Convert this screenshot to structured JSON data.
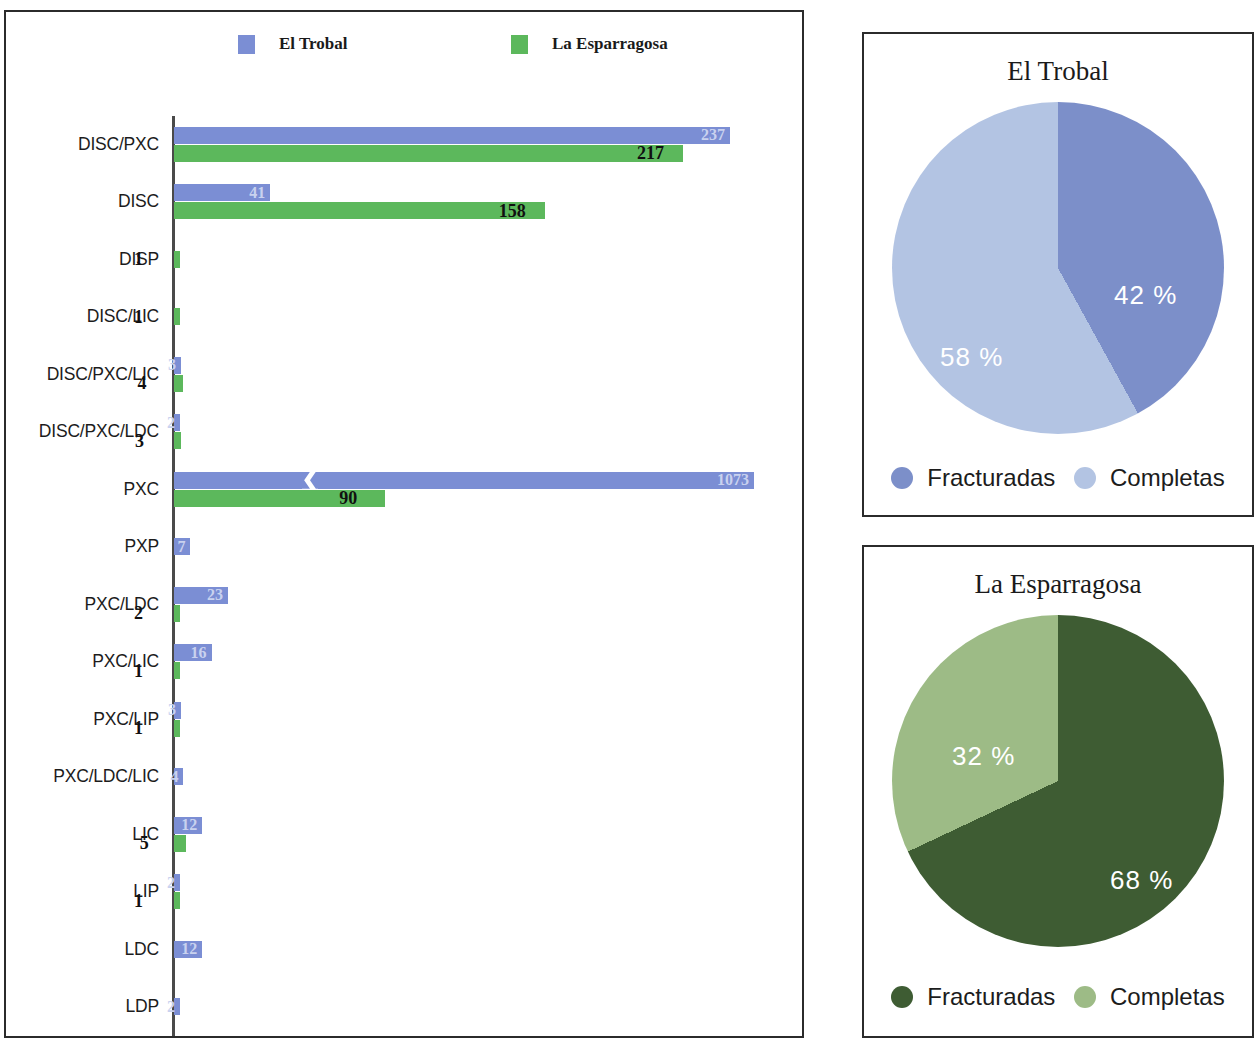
{
  "colors": {
    "trobal_bar": "#7b8ed4",
    "esparragosa_bar": "#5cb85c",
    "trobal_fracturadas": "#7c8fc9",
    "trobal_completas": "#b3c4e3",
    "esparragosa_fracturadas": "#3e5c33",
    "esparragosa_completas": "#9dbb86",
    "frame": "#2b2b2b"
  },
  "bar_legend": {
    "trobal": "El Trobal",
    "esparragosa": "La Esparragosa"
  },
  "chart_data": [
    {
      "type": "bar",
      "orientation": "horizontal",
      "title": "",
      "xlabel": "",
      "ylabel": "",
      "grid": false,
      "legend_position": "top",
      "axis_break": {
        "series": "El Trobal",
        "category": "PXC"
      },
      "categories": [
        "DISC/PXC",
        "DISC",
        "DISP",
        "DISC/LIC",
        "DISC/PXC/LIC",
        "DISC/PXC/LDC",
        "PXC",
        "PXP",
        "PXC/LDC",
        "PXC/LIC",
        "PXC/LIP",
        "PXC/LDC/LIC",
        "LIC",
        "LIP",
        "LDC",
        "LDP"
      ],
      "series": [
        {
          "name": "El Trobal",
          "color": "#7b8ed4",
          "values": [
            237,
            41,
            0,
            0,
            3,
            2,
            1073,
            7,
            23,
            16,
            3,
            4,
            12,
            2,
            12,
            2
          ]
        },
        {
          "name": "La Esparragosa",
          "color": "#5cb85c",
          "values": [
            217,
            158,
            1,
            1,
            4,
            3,
            90,
            0,
            2,
            1,
            1,
            0,
            5,
            1,
            0,
            0
          ]
        }
      ]
    },
    {
      "type": "pie",
      "title": "El Trobal",
      "labels": [
        "Fracturadas",
        "Completas"
      ],
      "values": [
        42,
        58
      ],
      "value_labels": [
        "42 %",
        "58 %"
      ],
      "colors": [
        "#7c8fc9",
        "#b3c4e3"
      ],
      "legend_position": "bottom"
    },
    {
      "type": "pie",
      "title": "La Esparragosa",
      "labels": [
        "Fracturadas",
        "Completas"
      ],
      "values": [
        68,
        32
      ],
      "value_labels": [
        "68 %",
        "32 %"
      ],
      "colors": [
        "#3e5c33",
        "#9dbb86"
      ],
      "legend_position": "bottom"
    }
  ]
}
